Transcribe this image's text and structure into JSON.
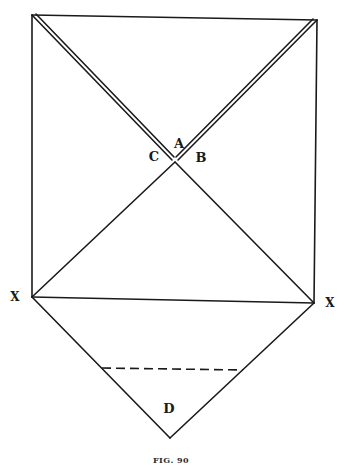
{
  "figure": {
    "caption": "FIG. 90",
    "ink_color": "#1a1a1a",
    "background": "#ffffff",
    "labels": {
      "A": "A",
      "B": "B",
      "C": "C",
      "X_left": "X",
      "X_right": "X",
      "D": "D"
    },
    "points": {
      "top_left": [
        32,
        15
      ],
      "top_right": [
        317,
        20
      ],
      "center": [
        175,
        162
      ],
      "x_left": [
        32,
        297
      ],
      "x_right": [
        314,
        303
      ],
      "bottom": [
        170,
        438
      ],
      "dash_start": [
        102,
        368
      ],
      "dash_end": [
        243,
        370
      ]
    }
  }
}
